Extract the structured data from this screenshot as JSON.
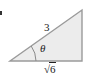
{
  "figure": {
    "type": "right-triangle",
    "fill_color": "#ececec",
    "stroke_color": "#9a9a9a",
    "vertices": {
      "angle_vertex": [
        10,
        61
      ],
      "right_angle_vertex": [
        82,
        61
      ],
      "top_vertex": [
        82,
        10
      ]
    },
    "labels": {
      "hypotenuse": "3",
      "adjacent_radical": "√",
      "adjacent_radicand": "6",
      "angle": "θ"
    },
    "marker": "bullet"
  }
}
